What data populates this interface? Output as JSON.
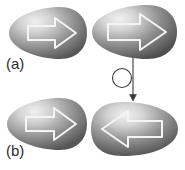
{
  "figure": {
    "width": 185,
    "height": 170,
    "background": "#ffffff",
    "type": "scientific-schematic-diagram"
  },
  "panels": [
    {
      "id": "a",
      "label": "(a)",
      "shapes": [
        {
          "name": "egg-top-left",
          "arrow_direction": "right",
          "x": 8,
          "y": 6,
          "w": 80,
          "h": 54,
          "fill_light": "#e8e8e8",
          "fill_dark": "#5d5d5d",
          "arrow_outline": "#f2f2f2"
        },
        {
          "name": "egg-top-right",
          "arrow_direction": "right",
          "x": 90,
          "y": 3,
          "w": 88,
          "h": 58,
          "fill_light": "#ececec",
          "fill_dark": "#555555",
          "arrow_outline": "#f2f2f2"
        }
      ]
    },
    {
      "id": "b",
      "label": "(b)",
      "shapes": [
        {
          "name": "egg-bottom-left",
          "arrow_direction": "right",
          "x": 6,
          "y": 97,
          "w": 82,
          "h": 54,
          "fill_light": "#e8e8e8",
          "fill_dark": "#5d5d5d",
          "arrow_outline": "#f2f2f2"
        },
        {
          "name": "egg-bottom-right",
          "arrow_direction": "left",
          "x": 90,
          "y": 100,
          "w": 90,
          "h": 58,
          "fill_light": "#ececec",
          "fill_dark": "#555555",
          "arrow_outline": "#f2f2f2"
        }
      ]
    }
  ],
  "transition": {
    "name": "rotation-transition-symbol",
    "circle": {
      "cx": 18,
      "cy": 22,
      "r": 9.5
    },
    "arrow": {
      "x": 29,
      "y_start": 2,
      "y_end": 44
    },
    "stroke": "#3a3a3a",
    "stroke_width": 1.1
  },
  "colors": {
    "background": "#ffffff",
    "label_text": "#2b2b2b",
    "egg_highlight": "#ededed",
    "egg_shadow": "#4f4f4f",
    "arrow_stroke": "#f5f5f5",
    "transition_stroke": "#3a3a3a"
  }
}
